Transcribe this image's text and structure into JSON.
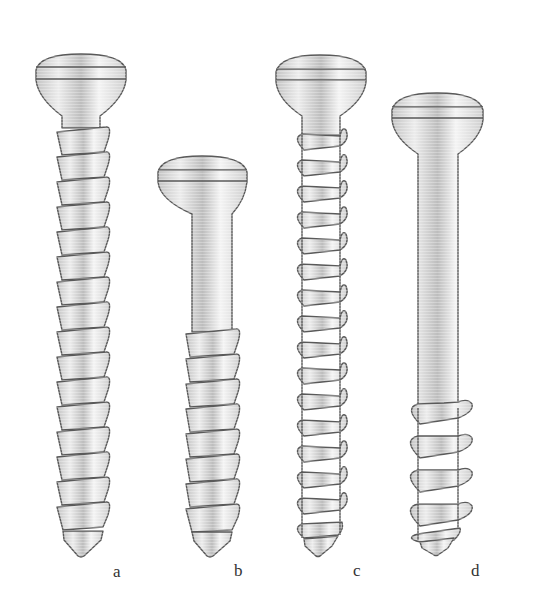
{
  "figure": {
    "colors": {
      "metal_light": "#f2f2f2",
      "metal_mid": "#d6d6d6",
      "metal_dark": "#b8b8b8",
      "outline": "#5a5a5a",
      "label": "#333333"
    },
    "screws": [
      {
        "id": "a",
        "label": "a",
        "type": "fully-threaded cortical",
        "label_x": 117,
        "label_y": 563
      },
      {
        "id": "b",
        "label": "b",
        "type": "partially-threaded cortical",
        "label_x": 236,
        "label_y": 562
      },
      {
        "id": "c",
        "label": "c",
        "type": "fully-threaded cancellous",
        "label_x": 354,
        "label_y": 562
      },
      {
        "id": "d",
        "label": "d",
        "type": "partially-threaded cancellous",
        "label_x": 472,
        "label_y": 562
      }
    ]
  }
}
